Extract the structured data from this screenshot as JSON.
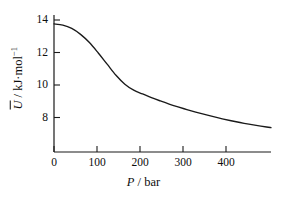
{
  "chart_data": {
    "type": "line",
    "title": "",
    "subtitle": "",
    "xlabel_symbol": "P",
    "xlabel_separator": " / ",
    "xlabel_unit": "bar",
    "xlabel": "P / bar",
    "ylabel_symbol": "U",
    "ylabel_separator": " / ",
    "ylabel_unit": "kJ·mol",
    "ylabel_unit_exponent": "−1",
    "ylabel": "Ū / kJ·mol⁻¹",
    "xlim": [
      0,
      490
    ],
    "ylim": [
      5.9,
      15.1
    ],
    "xticks": [
      0,
      100,
      200,
      300,
      400
    ],
    "xtick_labels": [
      "0",
      "100",
      "200",
      "300",
      "400"
    ],
    "yticks": [
      8,
      10,
      12,
      14
    ],
    "ytick_labels": [
      "8",
      "10",
      "12",
      "14"
    ],
    "grid": false,
    "legend": null,
    "line_color": "#1a1a1a",
    "axis_color": "#1a1a1a",
    "background_color": "#ffffff",
    "series": [
      {
        "name": "Molar internal energy vs pressure",
        "x": [
          0,
          20,
          40,
          60,
          80,
          100,
          120,
          140,
          160,
          180,
          200,
          220,
          240,
          260,
          280,
          300,
          320,
          340,
          360,
          380,
          400,
          420,
          440,
          460,
          480,
          490
        ],
        "y": [
          14.5,
          14.42,
          14.2,
          13.8,
          13.25,
          12.55,
          11.8,
          11.05,
          10.45,
          10.05,
          9.8,
          9.55,
          9.33,
          9.12,
          8.93,
          8.75,
          8.58,
          8.42,
          8.27,
          8.13,
          8.0,
          7.88,
          7.77,
          7.67,
          7.58,
          7.54
        ]
      }
    ]
  }
}
